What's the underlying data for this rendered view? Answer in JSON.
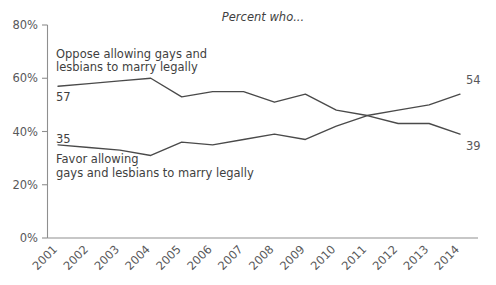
{
  "chart_data": {
    "type": "line",
    "title": "Percent who...",
    "xlabel": "",
    "ylabel": "",
    "x": [
      "2001",
      "2002",
      "2003",
      "2004",
      "2005",
      "2006",
      "2007",
      "2008",
      "2009",
      "2010",
      "2011",
      "2012",
      "2013",
      "2014"
    ],
    "categories": [
      "2001",
      "2002",
      "2003",
      "2004",
      "2005",
      "2006",
      "2007",
      "2008",
      "2009",
      "2010",
      "2011",
      "2012",
      "2013",
      "2014"
    ],
    "series": [
      {
        "name": "Oppose allowing gays and lesbians to marry legally",
        "values": [
          57,
          58,
          59,
          60,
          53,
          55,
          55,
          51,
          54,
          48,
          46,
          43,
          43,
          39
        ],
        "start_label": "57",
        "end_label": "39"
      },
      {
        "name": "Favor allowing gays and lesbians to marry legally",
        "values": [
          35,
          34,
          33,
          31,
          36,
          35,
          37,
          39,
          37,
          42,
          46,
          48,
          50,
          54
        ],
        "start_label": "35",
        "end_label": "54"
      }
    ],
    "ylim": [
      0,
      80
    ],
    "yticks": [
      0,
      20,
      40,
      60,
      80
    ],
    "ytick_labels": [
      "0%",
      "20%",
      "40%",
      "60%",
      "80%"
    ],
    "grid": false,
    "legend_position": "inline-annotation",
    "annotations": [
      {
        "id": "oppose-annotation",
        "line1": "Oppose allowing gays and",
        "line2": "lesbians to marry legally"
      },
      {
        "id": "favor-annotation",
        "line1": "Favor allowing",
        "line2": "gays and lesbians to marry legally"
      }
    ],
    "colors": {
      "line": "#4a4a4a",
      "axis": "#8f8f8f",
      "text": "#3f3f41",
      "tick_text": "#58585a",
      "background": "#ffffff"
    }
  }
}
